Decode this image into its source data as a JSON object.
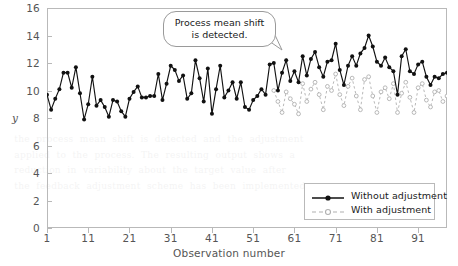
{
  "chart_data": {
    "type": "line",
    "title": "",
    "xlabel": "Observation number",
    "ylabel": "y",
    "xlim": [
      1,
      98
    ],
    "ylim": [
      0,
      16
    ],
    "ytick_labels": [
      "0",
      "2",
      "4",
      "6",
      "8",
      "10",
      "12",
      "14",
      "16"
    ],
    "ytick_values": [
      0,
      2,
      4,
      6,
      8,
      10,
      12,
      14,
      16
    ],
    "xtick_labels": [
      "1",
      "11",
      "21",
      "31",
      "41",
      "51",
      "61",
      "71",
      "81",
      "91"
    ],
    "xtick_values": [
      1,
      11,
      21,
      31,
      41,
      51,
      61,
      71,
      81,
      91
    ],
    "grid": false,
    "legend_position": "bottom-right",
    "annotations": [
      {
        "name": "process-mean-shift-callout",
        "line1": "Process mean shift",
        "line2": "is detected.",
        "points_to_observation": 56
      }
    ],
    "series": [
      {
        "name": "Without adjustment",
        "color": "#111111",
        "style": "solid",
        "marker": "filled-circle",
        "x": [
          1,
          2,
          3,
          4,
          5,
          6,
          7,
          8,
          9,
          10,
          11,
          12,
          13,
          14,
          15,
          16,
          17,
          18,
          19,
          20,
          21,
          22,
          23,
          24,
          25,
          26,
          27,
          28,
          29,
          30,
          31,
          32,
          33,
          34,
          35,
          36,
          37,
          38,
          39,
          40,
          41,
          42,
          43,
          44,
          45,
          46,
          47,
          48,
          49,
          50,
          51,
          52,
          53,
          54,
          55,
          56,
          57,
          58,
          59,
          60,
          61,
          62,
          63,
          64,
          65,
          66,
          67,
          68,
          69,
          70,
          71,
          72,
          73,
          74,
          75,
          76,
          77,
          78,
          79,
          80,
          81,
          82,
          83,
          84,
          85,
          86,
          87,
          88,
          89,
          90,
          91,
          92,
          93,
          94,
          95,
          96,
          97,
          98
        ],
        "values": [
          9.7,
          8.6,
          9.4,
          10.1,
          11.3,
          11.3,
          10.2,
          11.7,
          9.8,
          7.9,
          9.0,
          11.0,
          8.9,
          9.3,
          8.8,
          8.1,
          9.3,
          9.2,
          8.5,
          8.1,
          9.4,
          9.9,
          10.3,
          9.5,
          9.5,
          9.6,
          9.6,
          11.2,
          9.3,
          10.5,
          11.8,
          11.5,
          10.7,
          11.1,
          9.4,
          9.8,
          12.2,
          10.9,
          9.2,
          11.6,
          8.3,
          10.1,
          11.8,
          9.5,
          10.0,
          10.6,
          9.4,
          10.6,
          8.8,
          8.6,
          9.3,
          9.6,
          10.1,
          9.7,
          11.9,
          12.0,
          10.0,
          11.3,
          12.2,
          10.7,
          11.4,
          10.6,
          12.5,
          11.1,
          12.3,
          12.8,
          11.7,
          11.0,
          12.1,
          12.2,
          13.4,
          11.5,
          10.4,
          11.8,
          12.5,
          11.8,
          12.7,
          13.1,
          14.0,
          13.2,
          12.1,
          11.8,
          12.4,
          11.7,
          11.4,
          9.7,
          12.5,
          13.0,
          11.4,
          11.2,
          11.9,
          12.1,
          11.0,
          10.4,
          11.0,
          10.9,
          11.2,
          11.3
        ]
      },
      {
        "name": "With adjustment",
        "color": "#b0b0b0",
        "style": "dashed",
        "marker": "open-circle",
        "x": [
          56,
          57,
          58,
          59,
          60,
          61,
          62,
          63,
          64,
          65,
          66,
          67,
          68,
          69,
          70,
          71,
          72,
          73,
          74,
          75,
          76,
          77,
          78,
          79,
          80,
          81,
          82,
          83,
          84,
          85,
          86,
          87,
          88,
          89,
          90,
          91,
          92,
          93,
          94,
          95,
          96,
          97,
          98
        ],
        "values": [
          10.0,
          9.2,
          8.4,
          9.9,
          9.4,
          9.0,
          8.3,
          10.5,
          9.2,
          10.1,
          10.6,
          9.7,
          8.6,
          10.3,
          10.0,
          11.2,
          9.7,
          8.9,
          10.3,
          10.9,
          9.6,
          8.6,
          10.8,
          11.0,
          9.6,
          8.4,
          9.9,
          10.2,
          9.4,
          10.5,
          8.4,
          9.8,
          10.6,
          9.5,
          8.4,
          10.2,
          10.5,
          9.3,
          8.8,
          9.9,
          10.0,
          9.2,
          9.6
        ]
      }
    ]
  },
  "bleed_text": "  the  process  mean  shift  is  detected  and  the  adjustment\n  applied  to  the  process.  The  resulting  output  shows  a\n  reduction  in  variability  about  the  target  value  after\n  the  feedback  adjustment  scheme  has  been  implemented.",
  "colors": {
    "frame": "#b9b9b9",
    "axis_text": "#555555",
    "series_without": "#111111",
    "series_with": "#b0b0b0",
    "callout_border": "#9a9a9a",
    "background": "#ffffff"
  }
}
